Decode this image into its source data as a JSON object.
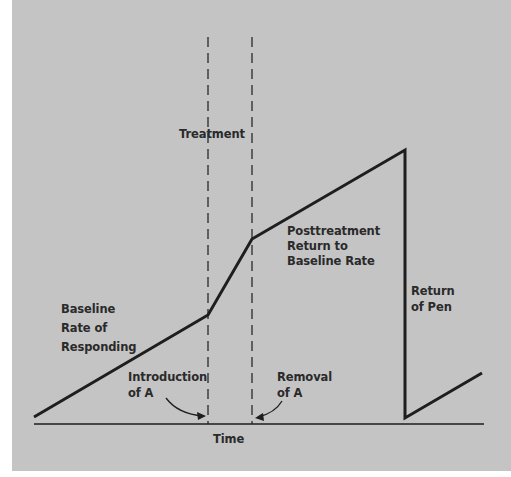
{
  "diagram": {
    "type": "cumulative-record",
    "labels": {
      "treatment": "Treatment",
      "posttreatment": [
        "Posttreatment",
        "Return to",
        "Baseline Rate"
      ],
      "baseline": [
        "Baseline",
        "Rate of",
        "Responding"
      ],
      "return_of_pen": [
        "Return",
        "of Pen"
      ],
      "introduction": [
        "Introduction",
        "of A"
      ],
      "removal": [
        "Removal",
        "of A"
      ],
      "x_axis": "Time"
    },
    "colors": {
      "background": "#c4c4c4",
      "ink": "#1e1e1e"
    },
    "segments": [
      {
        "name": "baseline",
        "from": [
          34,
          417
        ],
        "to": [
          208,
          315
        ]
      },
      {
        "name": "treatment",
        "from": [
          208,
          315
        ],
        "to": [
          252,
          239
        ]
      },
      {
        "name": "posttreatment",
        "from": [
          252,
          239
        ],
        "to": [
          405,
          150
        ]
      },
      {
        "name": "return-of-pen",
        "from": [
          405,
          150
        ],
        "to": [
          405,
          418
        ]
      },
      {
        "name": "resumed",
        "from": [
          405,
          418
        ],
        "to": [
          482,
          373
        ]
      }
    ]
  }
}
